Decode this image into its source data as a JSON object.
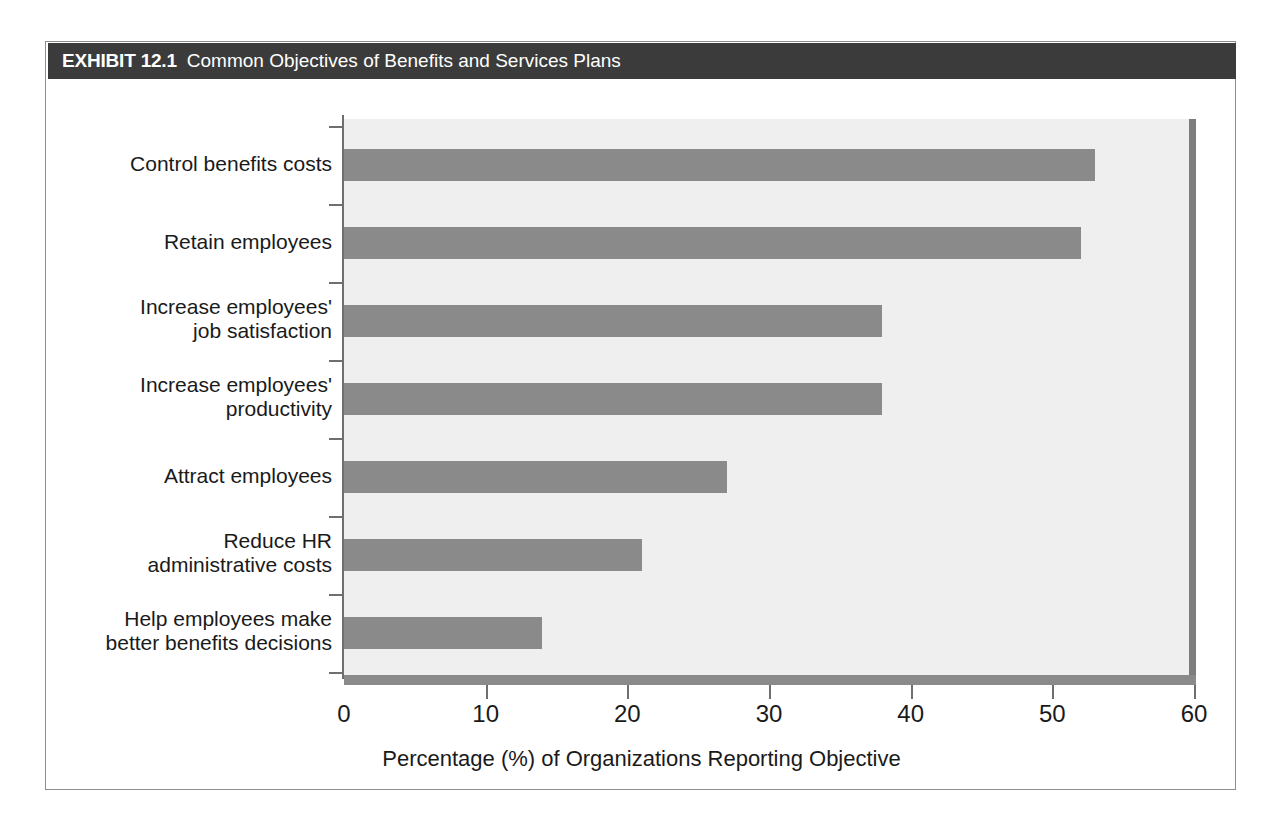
{
  "exhibit": {
    "number": "EXHIBIT 12.1",
    "caption": "Common Objectives of Benefits and Services Plans"
  },
  "colors": {
    "header_bar": "#3b3b3b",
    "bar_fill": "#8a8a8a",
    "plot_background": "#efefef",
    "axis": "#6f6f6f",
    "frame_border": "#8d8d8d",
    "text": "#1a1a1a"
  },
  "chart_data": {
    "type": "bar",
    "orientation": "horizontal",
    "title": "Common Objectives of Benefits and Services Plans",
    "xlabel": "Percentage (%) of Organizations Reporting Objective",
    "ylabel": "",
    "xlim": [
      0,
      60
    ],
    "xticks": [
      0,
      10,
      20,
      30,
      40,
      50,
      60
    ],
    "xtick_labels": [
      "0",
      "10",
      "20",
      "30",
      "40",
      "50",
      "60"
    ],
    "grid": false,
    "legend": null,
    "categories": [
      "Control benefits costs",
      "Retain employees",
      "Increase employees'\njob satisfaction",
      "Increase employees'\nproductivity",
      "Attract employees",
      "Reduce HR\nadministrative costs",
      "Help employees make\nbetter benefits decisions"
    ],
    "values": [
      53,
      52,
      38,
      38,
      27,
      21,
      14
    ]
  }
}
